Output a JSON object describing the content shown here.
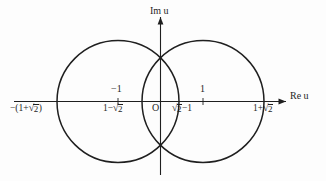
{
  "figure": {
    "kind": "complex-plane-diagram",
    "background_color": "#fdfdfd",
    "stroke_color": "#1f1f1f",
    "axes": {
      "real_axis_label": "Re u",
      "imag_axis_label": "Im u",
      "origin_label": "O"
    },
    "ticks": {
      "above_axis": [
        {
          "name": "minus-one",
          "text": "−1",
          "x_units": -1
        },
        {
          "name": "plus-one",
          "text": "1",
          "x_units": 1
        }
      ]
    },
    "labels_below_axis": [
      {
        "name": "left-outer-intercept",
        "prefix": "−(1+",
        "radic": "√",
        "radicand": "2",
        "suffix": ")",
        "x_units": -2.4142
      },
      {
        "name": "left-inner-intercept",
        "prefix": "1−",
        "radic": "√",
        "radicand": "2",
        "suffix": "",
        "x_units": -0.4142
      },
      {
        "name": "right-inner-intercept",
        "prefix": "",
        "radic": "√",
        "radicand": "2",
        "suffix": "−1",
        "x_units": 0.4142
      },
      {
        "name": "right-outer-intercept",
        "prefix": "1+",
        "radic": "√",
        "radicand": "2",
        "suffix": "",
        "x_units": 2.4142
      }
    ],
    "circles": [
      {
        "name": "left-circle",
        "center_units": [
          -1,
          0
        ],
        "radius_units": 1.4142
      },
      {
        "name": "right-circle",
        "center_units": [
          1,
          0
        ],
        "radius_units": 1.4142
      }
    ],
    "intersection_points": [
      {
        "name": "upper-intersection",
        "units": [
          0,
          1
        ]
      },
      {
        "name": "lower-intersection",
        "units": [
          0,
          -1
        ]
      }
    ]
  },
  "text": {
    "im_u": "Im u",
    "re_u": "Re u",
    "origin": "O",
    "tick_minus_one": "−1",
    "tick_plus_one": "1",
    "radic": "√",
    "two": "2",
    "left_outer_prefix": "−(1+",
    "left_outer_suffix": ")",
    "left_inner_prefix": "1−",
    "right_inner_suffix": "−1",
    "right_outer_prefix": "1+"
  }
}
